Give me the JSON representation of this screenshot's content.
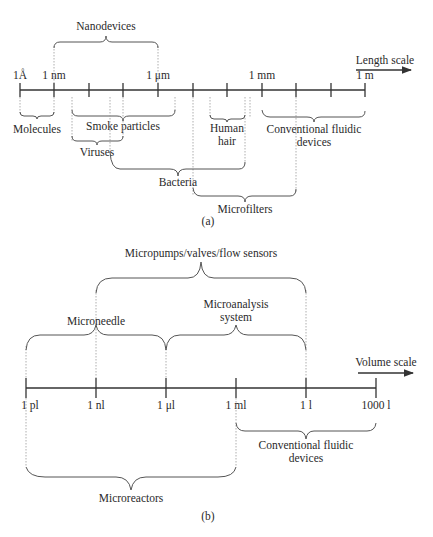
{
  "panel_a": {
    "caption": "(a)",
    "axis_label": "Length scale",
    "tick_labels": [
      {
        "label": "1Å",
        "x": 20
      },
      {
        "label": "1 nm",
        "x": 54
      },
      {
        "label": "1 μm",
        "x": 158
      },
      {
        "label": "1 mm",
        "x": 262
      },
      {
        "label": "1 m",
        "x": 365
      }
    ],
    "ticks_x": [
      20,
      54,
      89,
      123,
      158,
      193,
      227,
      262,
      296,
      331,
      365
    ],
    "ranges": [
      {
        "label": "Nanodevices",
        "from": "1 nm",
        "to": "1 μm",
        "side": "above"
      },
      {
        "label": "Molecules",
        "from": "1Å",
        "to": "1 nm",
        "side": "below"
      },
      {
        "label": "Smoke particles",
        "side": "below"
      },
      {
        "label": "Viruses",
        "side": "below"
      },
      {
        "label": "Human hair",
        "side": "below"
      },
      {
        "label": "Conventional fluidic devices",
        "from": "1 mm",
        "to": "1 m",
        "side": "below"
      },
      {
        "label": "Bacteria",
        "side": "below"
      },
      {
        "label": "Microfilters",
        "side": "below"
      }
    ],
    "labels": {
      "nanodevices": "Nanodevices",
      "molecules": "Molecules",
      "smoke": "Smoke particles",
      "viruses": "Viruses",
      "human1": "Human",
      "human2": "hair",
      "conv1": "Conventional fluidic",
      "conv2": "devices",
      "bacteria": "Bacteria",
      "microfilters": "Microfilters"
    }
  },
  "panel_b": {
    "caption": "(b)",
    "axis_label": "Volume scale",
    "tick_labels": [
      {
        "label": "1 pl",
        "x": 26
      },
      {
        "label": "1 nl",
        "x": 96
      },
      {
        "label": "1 μl",
        "x": 166
      },
      {
        "label": "1 ml",
        "x": 236
      },
      {
        "label": "1 l",
        "x": 306
      },
      {
        "label": "1000 l",
        "x": 376
      }
    ],
    "ranges": [
      {
        "label": "Micropumps/valves/flow sensors",
        "from": "1 nl",
        "to": "1 l",
        "side": "above"
      },
      {
        "label": "Microneedle",
        "from": "1 pl",
        "to": "1 μl",
        "side": "above"
      },
      {
        "label": "Microanalysis system",
        "from": "1 μl",
        "to": "1 l",
        "side": "above"
      },
      {
        "label": "Conventional fluidic devices",
        "from": "1 ml",
        "to": "1000 l",
        "side": "below"
      },
      {
        "label": "Microreactors",
        "from": "1 pl",
        "to": "1 ml",
        "side": "below"
      }
    ],
    "labels": {
      "micropumps": "Micropumps/valves/flow sensors",
      "microneedle": "Microneedle",
      "microanalysis1": "Microanalysis",
      "microanalysis2": "system",
      "conv1": "Conventional fluidic",
      "conv2": "devices",
      "microreactors": "Microreactors"
    }
  }
}
